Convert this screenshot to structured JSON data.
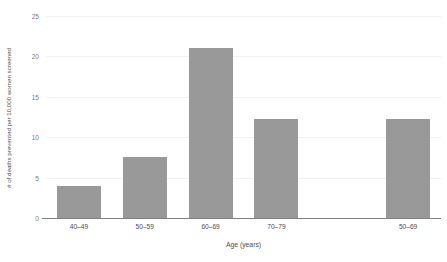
{
  "chart_data": {
    "type": "bar",
    "title": "",
    "subtitle": "",
    "xlabel": "Age (years)",
    "ylabel": "# of deaths prevented per 10,000 women screened",
    "categories": [
      "40–49",
      "50–59",
      "60–69",
      "70–79",
      "",
      "50–69"
    ],
    "values": [
      4,
      7.5,
      21,
      12.2,
      null,
      12.2
    ],
    "ylim": [
      0,
      25
    ],
    "yticks": [
      0,
      5,
      10,
      15,
      20,
      25
    ],
    "ytick_labels": [
      "0",
      "5",
      "10",
      "15",
      "20",
      "25"
    ],
    "grid": true,
    "grid_axis": "y",
    "legend": false,
    "legend_position": "none",
    "bar_color": "#999999",
    "axis_color": "#808080",
    "grid_color": "#f2f2f2",
    "text_color": "#4d4d4d",
    "background_color": "#ffffff"
  },
  "caption": {
    "clipped_text": ""
  }
}
